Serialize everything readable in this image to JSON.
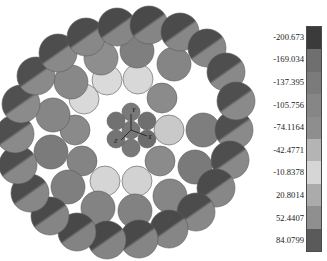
{
  "figure": {
    "title": "",
    "background_color": "#ffffff",
    "axes_triad": {
      "x_label": "X",
      "y_label": "Y",
      "z_label": "Z"
    }
  },
  "colorbar": {
    "orientation": "vertical",
    "tick_labels": [
      "-200.673",
      "-169.034",
      "-137.395",
      "-105.756",
      "-74.1164",
      "-42.4771",
      "-10.8378",
      "20.8014",
      "52.4407",
      "84.0799"
    ],
    "tick_values": [
      -200.673,
      -169.034,
      -137.395,
      -105.756,
      -74.1164,
      -42.4771,
      -10.8378,
      20.8014,
      52.4407,
      84.0799
    ],
    "segment_colors": [
      "#3b3b3b",
      "#6f6f6f",
      "#7b7b7b",
      "#868686",
      "#8e8e8e",
      "#b4b4b4",
      "#d6d6d6",
      "#ababab",
      "#8f8f8f",
      "#5a5a5a"
    ],
    "border_color": "#4a4a4a"
  },
  "chart_data": {
    "type": "scatter",
    "title": "",
    "xlabel": "",
    "ylabel": "",
    "colormap": "grayscale",
    "value_min": -200.673,
    "value_max": 84.0799,
    "rings": [
      {
        "name": "core",
        "count": 7,
        "radius_px": 0,
        "wire_radius_px": 9
      },
      {
        "name": "inner",
        "count": 12,
        "radius_px": 38,
        "wire_radius_px": 15
      },
      {
        "name": "middle",
        "count": 18,
        "radius_px": 70,
        "wire_radius_px": 17
      },
      {
        "name": "outer",
        "count": 24,
        "radius_px": 103,
        "wire_radius_px": 19
      }
    ],
    "wires": [
      {
        "id": "c0",
        "cx": 131,
        "cy": 130,
        "r": 9,
        "ring": "core",
        "value": -150.0,
        "fill": "#777777",
        "shade": "none"
      },
      {
        "id": "c1",
        "cx": 131,
        "cy": 112,
        "r": 9,
        "ring": "core",
        "value": -150.0,
        "fill": "#797979",
        "shade": "none"
      },
      {
        "id": "c2",
        "cx": 147,
        "cy": 121,
        "r": 9,
        "ring": "core",
        "value": -145.0,
        "fill": "#6f6f6f",
        "shade": "none"
      },
      {
        "id": "c3",
        "cx": 147,
        "cy": 139,
        "r": 9,
        "ring": "core",
        "value": -145.0,
        "fill": "#6d6d6d",
        "shade": "none"
      },
      {
        "id": "c4",
        "cx": 131,
        "cy": 148,
        "r": 9,
        "ring": "core",
        "value": -150.0,
        "fill": "#787878",
        "shade": "none"
      },
      {
        "id": "c5",
        "cx": 116,
        "cy": 139,
        "r": 9,
        "ring": "core",
        "value": -148.0,
        "fill": "#747474",
        "shade": "none"
      },
      {
        "id": "c6",
        "cx": 116,
        "cy": 121,
        "r": 9,
        "ring": "core",
        "value": -148.0,
        "fill": "#717171",
        "shade": "none"
      },
      {
        "id": "i0",
        "cx": 169,
        "cy": 130,
        "r": 15,
        "ring": "inner",
        "value": -35.0,
        "fill": "#c9c9c9",
        "shade": "none"
      },
      {
        "id": "i1",
        "cx": 160,
        "cy": 161,
        "r": 15,
        "ring": "inner",
        "value": -120.0,
        "fill": "#8b8b8b",
        "shade": "none"
      },
      {
        "id": "i2",
        "cx": 137,
        "cy": 181,
        "r": 15,
        "ring": "inner",
        "value": -25.0,
        "fill": "#d2d2d2",
        "shade": "none"
      },
      {
        "id": "i3",
        "cx": 105,
        "cy": 181,
        "r": 15,
        "ring": "inner",
        "value": -22.0,
        "fill": "#d5d5d5",
        "shade": "none"
      },
      {
        "id": "i4",
        "cx": 82,
        "cy": 161,
        "r": 15,
        "ring": "inner",
        "value": -130.0,
        "fill": "#848484",
        "shade": "none"
      },
      {
        "id": "i5",
        "cx": 75,
        "cy": 130,
        "r": 15,
        "ring": "inner",
        "value": -120.0,
        "fill": "#8a8a8a",
        "shade": "none"
      },
      {
        "id": "i6",
        "cx": 84,
        "cy": 99,
        "r": 15,
        "ring": "inner",
        "value": -20.0,
        "fill": "#d9d9d9",
        "shade": "none"
      },
      {
        "id": "i7",
        "cx": 107,
        "cy": 80,
        "r": 15,
        "ring": "inner",
        "value": -18.0,
        "fill": "#dadada",
        "shade": "none"
      },
      {
        "id": "i8",
        "cx": 138,
        "cy": 79,
        "r": 15,
        "ring": "inner",
        "value": -20.0,
        "fill": "#d8d8d8",
        "shade": "none"
      },
      {
        "id": "i9",
        "cx": 162,
        "cy": 98,
        "r": 15,
        "ring": "inner",
        "value": -120.0,
        "fill": "#8b8b8b",
        "shade": "none"
      },
      {
        "id": "m0",
        "cx": 203,
        "cy": 130,
        "r": 17,
        "ring": "middle",
        "value": -140.0,
        "fill": "#7e7e7e",
        "shade": "none"
      },
      {
        "id": "m1",
        "cx": 195,
        "cy": 167,
        "r": 17,
        "ring": "middle",
        "value": -145.0,
        "fill": "#7a7a7a",
        "shade": "none"
      },
      {
        "id": "m2",
        "cx": 170,
        "cy": 196,
        "r": 17,
        "ring": "middle",
        "value": -130.0,
        "fill": "#868686",
        "shade": "none"
      },
      {
        "id": "m3",
        "cx": 135,
        "cy": 211,
        "r": 17,
        "ring": "middle",
        "value": -135.0,
        "fill": "#828282",
        "shade": "none"
      },
      {
        "id": "m4",
        "cx": 98,
        "cy": 208,
        "r": 17,
        "ring": "middle",
        "value": -135.0,
        "fill": "#838383",
        "shade": "none"
      },
      {
        "id": "m5",
        "cx": 68,
        "cy": 187,
        "r": 17,
        "ring": "middle",
        "value": -140.0,
        "fill": "#7f7f7f",
        "shade": "none"
      },
      {
        "id": "m6",
        "cx": 51,
        "cy": 152,
        "r": 17,
        "ring": "middle",
        "value": -145.0,
        "fill": "#7b7b7b",
        "shade": "none"
      },
      {
        "id": "m7",
        "cx": 53,
        "cy": 115,
        "r": 17,
        "ring": "middle",
        "value": -130.0,
        "fill": "#868686",
        "shade": "none"
      },
      {
        "id": "m8",
        "cx": 71,
        "cy": 82,
        "r": 17,
        "ring": "middle",
        "value": -128.0,
        "fill": "#888888",
        "shade": "none"
      },
      {
        "id": "m9",
        "cx": 101,
        "cy": 58,
        "r": 17,
        "ring": "middle",
        "value": -120.0,
        "fill": "#8e8e8e",
        "shade": "none"
      },
      {
        "id": "m10",
        "cx": 137,
        "cy": 51,
        "r": 17,
        "ring": "middle",
        "value": -140.0,
        "fill": "#7f7f7f",
        "shade": "none"
      },
      {
        "id": "m11",
        "cx": 174,
        "cy": 64,
        "r": 17,
        "ring": "middle",
        "value": -130.0,
        "fill": "#858585",
        "shade": "none"
      },
      {
        "id": "o0",
        "cx": 234,
        "cy": 130,
        "r": 19,
        "ring": "outer",
        "value": -190.0,
        "fill": "#4f4f4f",
        "shade": "diag",
        "fill2": "#8a8a8a"
      },
      {
        "id": "o1",
        "cx": 230,
        "cy": 160,
        "r": 19,
        "ring": "outer",
        "value": -190.0,
        "fill": "#4e4e4e",
        "shade": "diag",
        "fill2": "#898989"
      },
      {
        "id": "o2",
        "cx": 216,
        "cy": 188,
        "r": 19,
        "ring": "outer",
        "value": -195.0,
        "fill": "#4b4b4b",
        "shade": "diag",
        "fill2": "#878787"
      },
      {
        "id": "o3",
        "cx": 196,
        "cy": 212,
        "r": 19,
        "ring": "outer",
        "value": -195.0,
        "fill": "#4c4c4c",
        "shade": "diag",
        "fill2": "#888888"
      },
      {
        "id": "o4",
        "cx": 169,
        "cy": 229,
        "r": 19,
        "ring": "outer",
        "value": -198.0,
        "fill": "#4a4a4a",
        "shade": "diag",
        "fill2": "#868686"
      },
      {
        "id": "o5",
        "cx": 139,
        "cy": 239,
        "r": 19,
        "ring": "outer",
        "value": -198.0,
        "fill": "#494949",
        "shade": "diag",
        "fill2": "#858585"
      },
      {
        "id": "o6",
        "cx": 107,
        "cy": 240,
        "r": 19,
        "ring": "outer",
        "value": -200.0,
        "fill": "#484848",
        "shade": "diag",
        "fill2": "#848484"
      },
      {
        "id": "o7",
        "cx": 77,
        "cy": 232,
        "r": 19,
        "ring": "outer",
        "value": -200.0,
        "fill": "#484848",
        "shade": "diag",
        "fill2": "#838383"
      },
      {
        "id": "o8",
        "cx": 50,
        "cy": 216,
        "r": 19,
        "ring": "outer",
        "value": -198.0,
        "fill": "#4a4a4a",
        "shade": "diag",
        "fill2": "#858585"
      },
      {
        "id": "o9",
        "cx": 30,
        "cy": 193,
        "r": 19,
        "ring": "outer",
        "value": -195.0,
        "fill": "#4c4c4c",
        "shade": "diag",
        "fill2": "#878787"
      },
      {
        "id": "o10",
        "cx": 18,
        "cy": 165,
        "r": 19,
        "ring": "outer",
        "value": -192.0,
        "fill": "#4e4e4e",
        "shade": "diag",
        "fill2": "#888888"
      },
      {
        "id": "o11",
        "cx": 15,
        "cy": 134,
        "r": 19,
        "ring": "outer",
        "value": -190.0,
        "fill": "#4f4f4f",
        "shade": "diag",
        "fill2": "#8a8a8a"
      },
      {
        "id": "o12",
        "cx": 21,
        "cy": 104,
        "r": 19,
        "ring": "outer",
        "value": -190.0,
        "fill": "#505050",
        "shade": "diag",
        "fill2": "#8b8b8b"
      },
      {
        "id": "o13",
        "cx": 36,
        "cy": 76,
        "r": 19,
        "ring": "outer",
        "value": -192.0,
        "fill": "#4f4f4f",
        "shade": "diag",
        "fill2": "#8a8a8a"
      },
      {
        "id": "o14",
        "cx": 58,
        "cy": 53,
        "r": 19,
        "ring": "outer",
        "value": -195.0,
        "fill": "#4d4d4d",
        "shade": "diag",
        "fill2": "#898989"
      },
      {
        "id": "o15",
        "cx": 86,
        "cy": 37,
        "r": 19,
        "ring": "outer",
        "value": -196.0,
        "fill": "#4c4c4c",
        "shade": "diag",
        "fill2": "#888888"
      },
      {
        "id": "o16",
        "cx": 117,
        "cy": 27,
        "r": 19,
        "ring": "outer",
        "value": -198.0,
        "fill": "#4a4a4a",
        "shade": "diag",
        "fill2": "#868686"
      },
      {
        "id": "o17",
        "cx": 149,
        "cy": 25,
        "r": 19,
        "ring": "outer",
        "value": -198.0,
        "fill": "#494949",
        "shade": "diag",
        "fill2": "#858585"
      },
      {
        "id": "o18",
        "cx": 180,
        "cy": 32,
        "r": 19,
        "ring": "outer",
        "value": -196.0,
        "fill": "#4b4b4b",
        "shade": "diag",
        "fill2": "#878787"
      },
      {
        "id": "o19",
        "cx": 207,
        "cy": 48,
        "r": 19,
        "ring": "outer",
        "value": -194.0,
        "fill": "#4d4d4d",
        "shade": "diag",
        "fill2": "#888888"
      },
      {
        "id": "o20",
        "cx": 226,
        "cy": 72,
        "r": 19,
        "ring": "outer",
        "value": -192.0,
        "fill": "#4e4e4e",
        "shade": "diag",
        "fill2": "#898989"
      },
      {
        "id": "o21",
        "cx": 236,
        "cy": 101,
        "r": 19,
        "ring": "outer",
        "value": -190.0,
        "fill": "#4f4f4f",
        "shade": "diag",
        "fill2": "#8a8a8a"
      }
    ]
  }
}
